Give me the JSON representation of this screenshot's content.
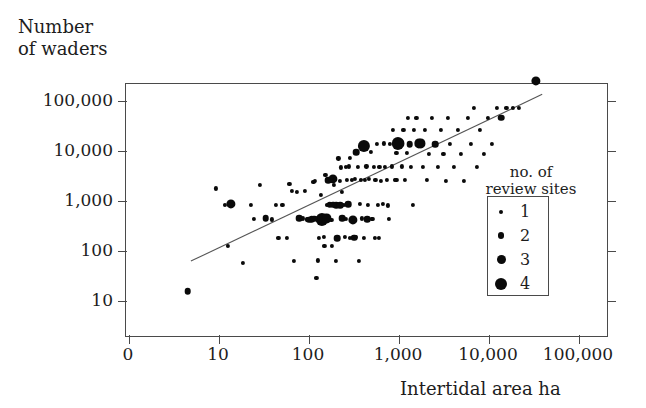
{
  "figure": {
    "y_axis_title": "Number\nof waders",
    "x_axis_title": "Intertidal area ha",
    "legend_title": "no. of\nreview sites",
    "point_color": "#0a0a0a",
    "axis_color": "#4a4a4a",
    "background": "#ffffff"
  },
  "legend": {
    "entries": [
      {
        "label": "1",
        "size": 4
      },
      {
        "label": "2",
        "size": 6.5
      },
      {
        "label": "3",
        "size": 9
      },
      {
        "label": "4",
        "size": 12
      }
    ]
  },
  "chart_data": {
    "type": "scatter",
    "title": "",
    "xlabel": "Intertidal area ha",
    "ylabel": "Number of waders",
    "xscale": "log",
    "yscale": "log",
    "xlim": [
      1,
      100000
    ],
    "ylim": [
      3,
      300000
    ],
    "grid": false,
    "legend_position": "inside-right",
    "xticklabels": [
      "0",
      "10",
      "100",
      "1,000",
      "10,000",
      "100,000"
    ],
    "yticklabels": [
      "10",
      "100",
      "1,000",
      "10,000",
      "100,000"
    ],
    "xtickvalues": [
      1,
      10,
      100,
      1000,
      10000,
      100000
    ],
    "ytickvalues": [
      10,
      100,
      1000,
      10000,
      100000
    ],
    "size_legend": {
      "name": "no. of review sites",
      "levels": [
        1,
        2,
        3,
        4
      ]
    },
    "trend_line": {
      "x": [
        5,
        40000
      ],
      "y": [
        60,
        130000
      ],
      "style": "solid"
    },
    "points": [
      {
        "x": 4.6,
        "y": 15,
        "n": 2
      },
      {
        "x": 9.5,
        "y": 1700,
        "n": 1
      },
      {
        "x": 12,
        "y": 800,
        "n": 1
      },
      {
        "x": 14,
        "y": 820,
        "n": 3
      },
      {
        "x": 13,
        "y": 120,
        "n": 1
      },
      {
        "x": 19,
        "y": 55,
        "n": 1
      },
      {
        "x": 23,
        "y": 790,
        "n": 1
      },
      {
        "x": 25,
        "y": 420,
        "n": 1
      },
      {
        "x": 29,
        "y": 2000,
        "n": 1
      },
      {
        "x": 34,
        "y": 430,
        "n": 2
      },
      {
        "x": 40,
        "y": 410,
        "n": 1
      },
      {
        "x": 44,
        "y": 790,
        "n": 1
      },
      {
        "x": 47,
        "y": 175,
        "n": 1
      },
      {
        "x": 52,
        "y": 800,
        "n": 1
      },
      {
        "x": 58,
        "y": 175,
        "n": 1
      },
      {
        "x": 62,
        "y": 2100,
        "n": 1
      },
      {
        "x": 66,
        "y": 1500,
        "n": 1
      },
      {
        "x": 70,
        "y": 60,
        "n": 1
      },
      {
        "x": 76,
        "y": 1450,
        "n": 1
      },
      {
        "x": 80,
        "y": 430,
        "n": 2
      },
      {
        "x": 88,
        "y": 430,
        "n": 1
      },
      {
        "x": 92,
        "y": 1500,
        "n": 1
      },
      {
        "x": 97,
        "y": 410,
        "n": 1
      },
      {
        "x": 103,
        "y": 400,
        "n": 2
      },
      {
        "x": 110,
        "y": 410,
        "n": 2
      },
      {
        "x": 115,
        "y": 2300,
        "n": 1
      },
      {
        "x": 120,
        "y": 2400,
        "n": 1
      },
      {
        "x": 124,
        "y": 28,
        "n": 1
      },
      {
        "x": 128,
        "y": 62,
        "n": 1
      },
      {
        "x": 132,
        "y": 175,
        "n": 1
      },
      {
        "x": 138,
        "y": 1250,
        "n": 1
      },
      {
        "x": 143,
        "y": 410,
        "n": 4
      },
      {
        "x": 150,
        "y": 180,
        "n": 1
      },
      {
        "x": 156,
        "y": 3200,
        "n": 1
      },
      {
        "x": 162,
        "y": 800,
        "n": 1
      },
      {
        "x": 168,
        "y": 2500,
        "n": 2
      },
      {
        "x": 175,
        "y": 810,
        "n": 2
      },
      {
        "x": 182,
        "y": 400,
        "n": 1
      },
      {
        "x": 190,
        "y": 2600,
        "n": 3
      },
      {
        "x": 198,
        "y": 2600,
        "n": 1
      },
      {
        "x": 205,
        "y": 790,
        "n": 2
      },
      {
        "x": 210,
        "y": 170,
        "n": 2
      },
      {
        "x": 218,
        "y": 6800,
        "n": 1
      },
      {
        "x": 225,
        "y": 2400,
        "n": 1
      },
      {
        "x": 232,
        "y": 4500,
        "n": 1
      },
      {
        "x": 240,
        "y": 430,
        "n": 2
      },
      {
        "x": 248,
        "y": 800,
        "n": 1
      },
      {
        "x": 255,
        "y": 180,
        "n": 1
      },
      {
        "x": 262,
        "y": 4600,
        "n": 1
      },
      {
        "x": 270,
        "y": 2550,
        "n": 1
      },
      {
        "x": 278,
        "y": 820,
        "n": 2
      },
      {
        "x": 285,
        "y": 4700,
        "n": 1
      },
      {
        "x": 295,
        "y": 7000,
        "n": 1
      },
      {
        "x": 305,
        "y": 2500,
        "n": 1
      },
      {
        "x": 315,
        "y": 400,
        "n": 3
      },
      {
        "x": 325,
        "y": 175,
        "n": 2
      },
      {
        "x": 335,
        "y": 2600,
        "n": 1
      },
      {
        "x": 345,
        "y": 9000,
        "n": 2
      },
      {
        "x": 360,
        "y": 4600,
        "n": 1
      },
      {
        "x": 375,
        "y": 820,
        "n": 1
      },
      {
        "x": 390,
        "y": 2550,
        "n": 1
      },
      {
        "x": 400,
        "y": 430,
        "n": 1
      },
      {
        "x": 415,
        "y": 12000,
        "n": 4
      },
      {
        "x": 430,
        "y": 2500,
        "n": 1
      },
      {
        "x": 445,
        "y": 4700,
        "n": 1
      },
      {
        "x": 460,
        "y": 790,
        "n": 1
      },
      {
        "x": 480,
        "y": 2600,
        "n": 1
      },
      {
        "x": 500,
        "y": 9000,
        "n": 1
      },
      {
        "x": 520,
        "y": 420,
        "n": 1
      },
      {
        "x": 540,
        "y": 4600,
        "n": 1
      },
      {
        "x": 560,
        "y": 2500,
        "n": 1
      },
      {
        "x": 580,
        "y": 13000,
        "n": 1
      },
      {
        "x": 600,
        "y": 800,
        "n": 1
      },
      {
        "x": 620,
        "y": 4600,
        "n": 1
      },
      {
        "x": 650,
        "y": 2400,
        "n": 1
      },
      {
        "x": 680,
        "y": 820,
        "n": 1
      },
      {
        "x": 700,
        "y": 13500,
        "n": 1
      },
      {
        "x": 720,
        "y": 4600,
        "n": 1
      },
      {
        "x": 750,
        "y": 2500,
        "n": 1
      },
      {
        "x": 780,
        "y": 780,
        "n": 1
      },
      {
        "x": 810,
        "y": 13000,
        "n": 1
      },
      {
        "x": 850,
        "y": 4700,
        "n": 1
      },
      {
        "x": 880,
        "y": 25000,
        "n": 1
      },
      {
        "x": 920,
        "y": 2500,
        "n": 1
      },
      {
        "x": 960,
        "y": 8800,
        "n": 1
      },
      {
        "x": 1000,
        "y": 13500,
        "n": 4
      },
      {
        "x": 1050,
        "y": 13500,
        "n": 3
      },
      {
        "x": 1100,
        "y": 4700,
        "n": 1
      },
      {
        "x": 1150,
        "y": 25500,
        "n": 1
      },
      {
        "x": 1200,
        "y": 2500,
        "n": 1
      },
      {
        "x": 1250,
        "y": 8800,
        "n": 1
      },
      {
        "x": 1300,
        "y": 44000,
        "n": 1
      },
      {
        "x": 1350,
        "y": 13000,
        "n": 2
      },
      {
        "x": 1400,
        "y": 4600,
        "n": 1
      },
      {
        "x": 1450,
        "y": 800,
        "n": 1
      },
      {
        "x": 1500,
        "y": 25000,
        "n": 1
      },
      {
        "x": 1600,
        "y": 44000,
        "n": 1
      },
      {
        "x": 1700,
        "y": 13500,
        "n": 3
      },
      {
        "x": 1800,
        "y": 13500,
        "n": 3
      },
      {
        "x": 1900,
        "y": 4600,
        "n": 1
      },
      {
        "x": 2000,
        "y": 25000,
        "n": 1
      },
      {
        "x": 2100,
        "y": 2500,
        "n": 1
      },
      {
        "x": 2200,
        "y": 8500,
        "n": 1
      },
      {
        "x": 2400,
        "y": 44000,
        "n": 1
      },
      {
        "x": 2600,
        "y": 13000,
        "n": 2
      },
      {
        "x": 2800,
        "y": 4600,
        "n": 1
      },
      {
        "x": 3000,
        "y": 25000,
        "n": 1
      },
      {
        "x": 3200,
        "y": 8500,
        "n": 1
      },
      {
        "x": 3400,
        "y": 2450,
        "n": 1
      },
      {
        "x": 3600,
        "y": 44000,
        "n": 1
      },
      {
        "x": 3800,
        "y": 13000,
        "n": 1
      },
      {
        "x": 4200,
        "y": 4600,
        "n": 1
      },
      {
        "x": 4600,
        "y": 25000,
        "n": 1
      },
      {
        "x": 5000,
        "y": 8500,
        "n": 1
      },
      {
        "x": 5400,
        "y": 2400,
        "n": 1
      },
      {
        "x": 6000,
        "y": 44000,
        "n": 1
      },
      {
        "x": 6500,
        "y": 13000,
        "n": 1
      },
      {
        "x": 7000,
        "y": 70000,
        "n": 1
      },
      {
        "x": 7500,
        "y": 4600,
        "n": 1
      },
      {
        "x": 8200,
        "y": 25000,
        "n": 1
      },
      {
        "x": 9000,
        "y": 8500,
        "n": 1
      },
      {
        "x": 10000,
        "y": 44000,
        "n": 1
      },
      {
        "x": 11000,
        "y": 13000,
        "n": 1
      },
      {
        "x": 12500,
        "y": 70000,
        "n": 1
      },
      {
        "x": 14000,
        "y": 44000,
        "n": 2
      },
      {
        "x": 16000,
        "y": 70000,
        "n": 1
      },
      {
        "x": 19000,
        "y": 70000,
        "n": 1
      },
      {
        "x": 22000,
        "y": 70000,
        "n": 1
      },
      {
        "x": 34000,
        "y": 240000,
        "n": 3
      },
      {
        "x": 160,
        "y": 430,
        "n": 3
      },
      {
        "x": 133,
        "y": 410,
        "n": 2
      },
      {
        "x": 118,
        "y": 420,
        "n": 2
      },
      {
        "x": 192,
        "y": 800,
        "n": 2
      },
      {
        "x": 228,
        "y": 790,
        "n": 2
      },
      {
        "x": 265,
        "y": 420,
        "n": 1
      },
      {
        "x": 290,
        "y": 175,
        "n": 1
      },
      {
        "x": 340,
        "y": 180,
        "n": 1
      },
      {
        "x": 370,
        "y": 60,
        "n": 1
      },
      {
        "x": 420,
        "y": 175,
        "n": 1
      },
      {
        "x": 455,
        "y": 410,
        "n": 2
      },
      {
        "x": 510,
        "y": 420,
        "n": 1
      },
      {
        "x": 555,
        "y": 175,
        "n": 1
      },
      {
        "x": 610,
        "y": 175,
        "n": 1
      },
      {
        "x": 196,
        "y": 2000,
        "n": 1
      },
      {
        "x": 240,
        "y": 1450,
        "n": 1
      },
      {
        "x": 206,
        "y": 60,
        "n": 1
      },
      {
        "x": 185,
        "y": 120,
        "n": 1
      },
      {
        "x": 152,
        "y": 120,
        "n": 1
      },
      {
        "x": 960,
        "y": 2500,
        "n": 1
      },
      {
        "x": 790,
        "y": 420,
        "n": 1
      }
    ]
  }
}
